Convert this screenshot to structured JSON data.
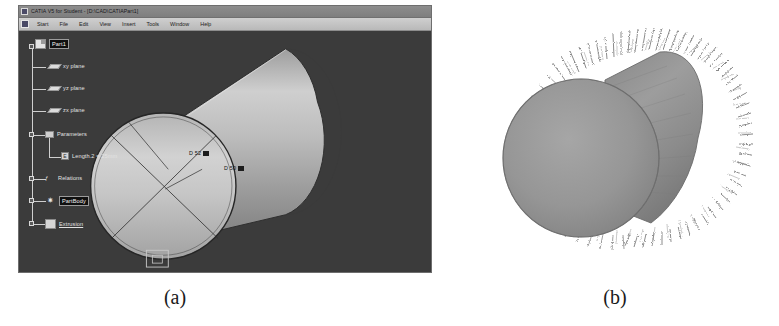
{
  "figure": {
    "caption_a": "(a)",
    "caption_b": "(b)"
  },
  "cad_window": {
    "title": "CATIA V5 for Student - [D:\\CAD\\CATIAPart1]",
    "app_icon": "catia-app-icon",
    "menu": {
      "start_icon": "start-menu-icon",
      "items": [
        {
          "label": "Start"
        },
        {
          "label": "File"
        },
        {
          "label": "Edit"
        },
        {
          "label": "View"
        },
        {
          "label": "Insert"
        },
        {
          "label": "Tools"
        },
        {
          "label": "Window"
        },
        {
          "label": "Help"
        }
      ]
    },
    "spec_tree": [
      {
        "label": "Part1",
        "icon": "part-icon",
        "selected": true
      },
      {
        "label": "xy plane",
        "icon": "plane-icon",
        "selected": false
      },
      {
        "label": "yz plane",
        "icon": "plane-icon",
        "selected": false
      },
      {
        "label": "zx plane",
        "icon": "plane-icon",
        "selected": false
      },
      {
        "label": "Parameters",
        "icon": "parameters-icon",
        "selected": false
      },
      {
        "label": "Length.2 = 25mm",
        "icon": "length-parameter-icon",
        "selected": false
      },
      {
        "label": "Relations",
        "icon": "relations-icon",
        "selected": false
      },
      {
        "label": "PartBody",
        "icon": "partbody-icon",
        "selected": true
      },
      {
        "label": "Extrusion",
        "icon": "extrusion-icon",
        "selected": false
      }
    ],
    "viewport": {
      "background_color": "#3b3b3b",
      "part_color": "#b8b8b8",
      "dimensions": [
        {
          "label": "D 52"
        },
        {
          "label": "D 50"
        }
      ]
    }
  },
  "render_b": {
    "description": "bristle-roller-render",
    "core_color": "#8e8e8e",
    "bristle_color": "#6f6f6f",
    "background_color": "#ffffff"
  }
}
